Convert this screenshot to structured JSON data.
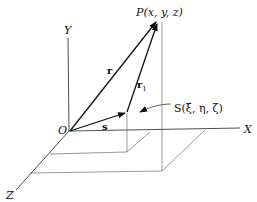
{
  "diagram": {
    "axes": {
      "x_label": "X",
      "y_label": "Y",
      "z_label": "Z",
      "origin_label": "O"
    },
    "points": {
      "p_label": "P(x, y, z)",
      "s_label": "S(ξ, η, ζ)"
    },
    "vectors": {
      "r_label": "r",
      "r1_label": "r",
      "r1_sub": "1",
      "s_label": "s"
    }
  }
}
